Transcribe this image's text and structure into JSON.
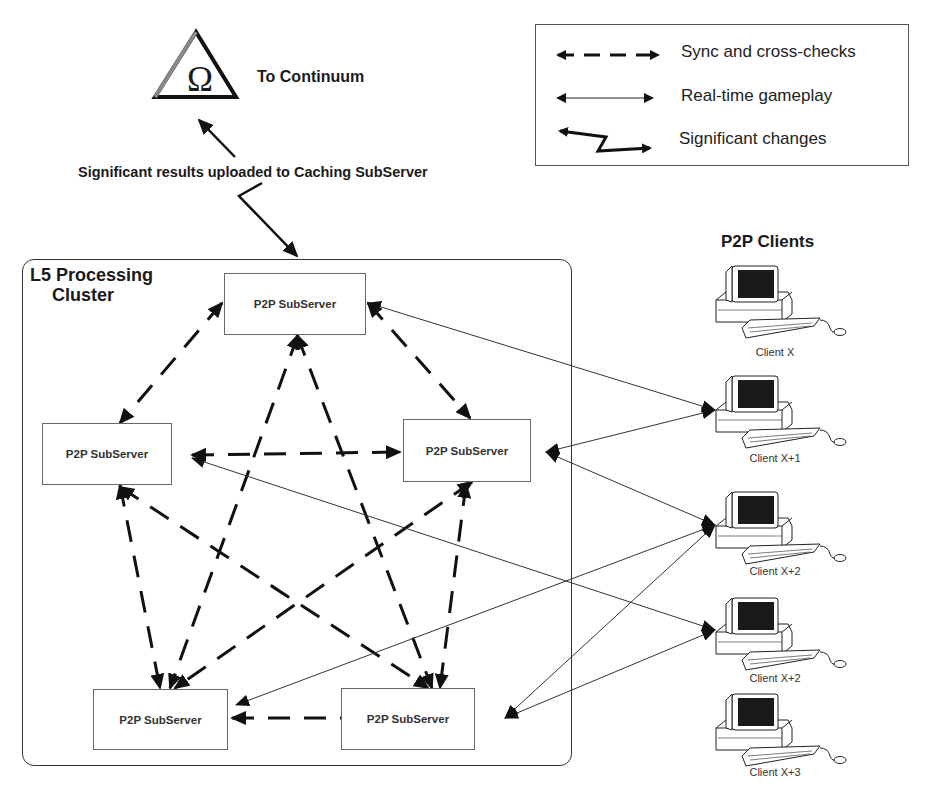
{
  "continuum": {
    "symbol": "Ω",
    "label": "To Continuum",
    "upload_label": "Significant results uploaded to Caching SubServer"
  },
  "legend": {
    "items": [
      {
        "style": "dashed",
        "label": "Sync and cross-checks"
      },
      {
        "style": "thin",
        "label": "Real-time gameplay"
      },
      {
        "style": "zigzag",
        "label": "Significant changes"
      }
    ]
  },
  "cluster": {
    "title_line1": "L5 Processing",
    "title_line2": "Cluster",
    "servers": [
      {
        "id": "top",
        "label": "P2P SubServer"
      },
      {
        "id": "left",
        "label": "P2P SubServer"
      },
      {
        "id": "right",
        "label": "P2P SubServer"
      },
      {
        "id": "bottom-left",
        "label": "P2P SubServer"
      },
      {
        "id": "bottom-right",
        "label": "P2P SubServer"
      }
    ],
    "sync_links": [
      [
        "top",
        "left"
      ],
      [
        "top",
        "right"
      ],
      [
        "top",
        "bottom-left"
      ],
      [
        "top",
        "bottom-right"
      ],
      [
        "left",
        "right"
      ],
      [
        "left",
        "bottom-left"
      ],
      [
        "left",
        "bottom-right"
      ],
      [
        "right",
        "bottom-left"
      ],
      [
        "right",
        "bottom-right"
      ],
      [
        "bottom-left",
        "bottom-right"
      ]
    ]
  },
  "clients": {
    "title": "P2P Clients",
    "items": [
      {
        "id": "c0",
        "label": "Client X"
      },
      {
        "id": "c1",
        "label": "Client X+1"
      },
      {
        "id": "c2",
        "label": "Client X+2"
      },
      {
        "id": "c3",
        "label": "Client X+2"
      },
      {
        "id": "c4",
        "label": "Client X+3"
      }
    ]
  },
  "gameplay_links": [
    [
      "top",
      "c1"
    ],
    [
      "right",
      "c1"
    ],
    [
      "right",
      "c2"
    ],
    [
      "left",
      "c3"
    ],
    [
      "bottom-left",
      "c2"
    ],
    [
      "bottom-right",
      "c2"
    ],
    [
      "bottom-right",
      "c3"
    ]
  ]
}
